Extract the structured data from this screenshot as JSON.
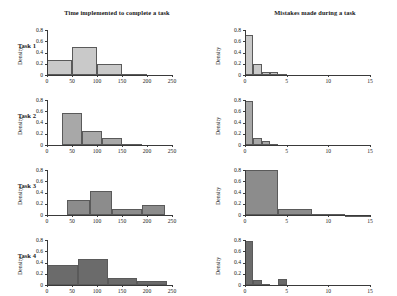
{
  "figure": {
    "columns": [
      {
        "id": "time",
        "title": "Time implemented to complete a task"
      },
      {
        "id": "mistakes",
        "title": "Mistakes made during a task"
      }
    ],
    "row_labels": [
      "Task 1",
      "Task 2",
      "Task 3",
      "Task 4"
    ],
    "ylabel": "Density",
    "xlabel_left": "Time (seconds)",
    "xlabel_right": "Number of errors",
    "y_ticks": [
      "0",
      "0.2",
      "0.4",
      "0.6",
      "0.8"
    ],
    "x_ticks_left": [
      "0",
      "50",
      "100",
      "150",
      "200",
      "250"
    ],
    "x_ticks_right": [
      "0",
      "5",
      "10",
      "15"
    ],
    "colors": {
      "bar_task1": "#c9c9c9",
      "bar_task2": "#a8a8a8",
      "bar_task3": "#8c8c8c",
      "bar_task4": "#6b6b6b",
      "bar_edge": "#5a5a5a",
      "axis": "#3a3a3a",
      "background": "#ffffff"
    }
  },
  "chart_data": [
    {
      "type": "bar",
      "title": "Time implemented to complete a task",
      "subtitle": "Task 1",
      "xlabel": "Time (seconds)",
      "ylabel": "Density",
      "xlim": [
        0,
        250
      ],
      "ylim": [
        0,
        0.8
      ],
      "grid": false,
      "bin_edges": [
        0,
        50,
        100,
        150,
        200
      ],
      "values": [
        0.27,
        0.49,
        0.2,
        0.01
      ],
      "color": "#c9c9c9"
    },
    {
      "type": "bar",
      "title": "Mistakes made during a task",
      "subtitle": "Task 1",
      "xlabel": "Number of errors",
      "ylabel": "Density",
      "xlim": [
        0,
        15
      ],
      "ylim": [
        0,
        0.8
      ],
      "grid": false,
      "bin_edges": [
        0,
        1,
        2,
        3,
        4,
        5
      ],
      "values": [
        0.71,
        0.19,
        0.06,
        0.05,
        0.02
      ],
      "color": "#c9c9c9"
    },
    {
      "type": "bar",
      "title": "Time implemented to complete a task",
      "subtitle": "Task 2",
      "xlabel": "Time (seconds)",
      "ylabel": "Density",
      "xlim": [
        0,
        250
      ],
      "ylim": [
        0,
        0.8
      ],
      "grid": false,
      "bin_edges": [
        30,
        70,
        110,
        150,
        190
      ],
      "values": [
        0.57,
        0.25,
        0.13,
        0.01
      ],
      "color": "#a8a8a8"
    },
    {
      "type": "bar",
      "title": "Mistakes made during a task",
      "subtitle": "Task 2",
      "xlabel": "Number of errors",
      "ylabel": "Density",
      "xlim": [
        0,
        15
      ],
      "ylim": [
        0,
        0.8
      ],
      "grid": false,
      "bin_edges": [
        0,
        1,
        2,
        3,
        4
      ],
      "values": [
        0.78,
        0.13,
        0.07,
        0.02
      ],
      "color": "#a8a8a8"
    },
    {
      "type": "bar",
      "title": "Time implemented to complete a task",
      "subtitle": "Task 3",
      "xlabel": "Time (seconds)",
      "ylabel": "Density",
      "xlim": [
        0,
        250
      ],
      "ylim": [
        0,
        0.8
      ],
      "grid": false,
      "bin_edges": [
        40,
        85,
        130,
        190,
        235
      ],
      "values": [
        0.26,
        0.43,
        0.1,
        0.17
      ],
      "color": "#8c8c8c"
    },
    {
      "type": "bar",
      "title": "Mistakes made during a task",
      "subtitle": "Task 3",
      "xlabel": "Number of errors",
      "ylabel": "Density",
      "xlim": [
        0,
        15
      ],
      "ylim": [
        0,
        0.8
      ],
      "grid": false,
      "bin_edges": [
        0,
        4,
        8,
        12,
        15
      ],
      "values": [
        0.8,
        0.1,
        0.02,
        0.005
      ],
      "color": "#8c8c8c"
    },
    {
      "type": "bar",
      "title": "Time implemented to complete a task",
      "subtitle": "Task 4",
      "xlabel": "Time (seconds)",
      "ylabel": "Density",
      "xlim": [
        0,
        250
      ],
      "ylim": [
        0,
        0.8
      ],
      "grid": false,
      "bin_edges": [
        0,
        62,
        122,
        180,
        240
      ],
      "values": [
        0.35,
        0.47,
        0.12,
        0.08
      ],
      "color": "#6b6b6b"
    },
    {
      "type": "bar",
      "title": "Mistakes made during a task",
      "subtitle": "Task 4",
      "xlabel": "Number of errors",
      "ylabel": "Density",
      "xlim": [
        0,
        15
      ],
      "ylim": [
        0,
        0.8
      ],
      "grid": false,
      "bin_edges": [
        0,
        1,
        2,
        3,
        4,
        5
      ],
      "values": [
        0.78,
        0.09,
        0.02,
        0.0,
        0.11
      ],
      "color": "#6b6b6b"
    }
  ]
}
